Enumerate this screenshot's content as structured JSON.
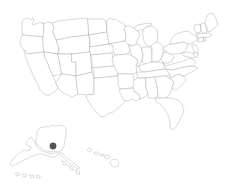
{
  "map": {
    "title": "United States Choropleth Outline Map",
    "projection": "albers-usa",
    "background_color": "#ffffff",
    "state_fill": "#ffffff",
    "state_stroke": "#a8a8a8",
    "inset_stroke": "#b0b0b0",
    "stroke_width": 0.45,
    "width": 232,
    "height": 189
  },
  "markers": [
    {
      "name": "alaska-marker",
      "label": "Alaska",
      "region": "south-central Alaska",
      "x": 53,
      "y": 146,
      "radius": 3.2,
      "fill": "#555555",
      "stroke": "#4a4a4a"
    }
  ],
  "insets": [
    {
      "name": "alaska-inset",
      "label": "Alaska"
    },
    {
      "name": "hawaii-inset",
      "label": "Hawaii"
    }
  ],
  "regions": {
    "contiguous": "Contiguous United States",
    "alaska": "Alaska",
    "hawaii": "Hawaii"
  }
}
